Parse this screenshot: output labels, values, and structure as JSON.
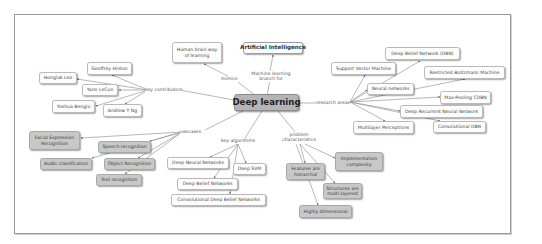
{
  "concept_map": {
    "central": "Deep learning",
    "parent": {
      "label": "Artificial Intelligence",
      "link": "Machine learning branch for"
    },
    "mimics": {
      "label": "Human brain way of learning",
      "link": "mimics"
    },
    "research_areas": {
      "link": "research areas",
      "items": [
        "Support Vector Machine",
        "Deep Belief Network (DBN)",
        "Restricted Boltzmann Machine",
        "Neural networks",
        "Max-Pooling CDBN",
        "Deep Recurrent Neural Network",
        "Convolutional DBN",
        "Multilayer Perceptrons"
      ]
    },
    "key_contributors": {
      "link": "key contributors",
      "items": [
        "Geoffrey Hinton",
        "Honglak Lee",
        "Yann LeCun",
        "Yoshua Bengio",
        "Andrew Y Ng"
      ]
    },
    "usecases": {
      "link": "usecases",
      "items": [
        "Facial Expression Recognition",
        "Speech recognition",
        "Audio classification",
        "Object Recognition",
        "Text recognition"
      ]
    },
    "key_algorithms": {
      "link": "key algorithms",
      "items": [
        "Deep Neural Networks",
        "Deep SVM",
        "Deep Belief Networks",
        "Convolutional Deep Belief Networks"
      ]
    },
    "problem_characteristics": {
      "link": "problem characteristics",
      "items": [
        "Features are hierarchal",
        "Implementation complexity",
        "Structures are multi-layered",
        "Highly dimensional"
      ]
    }
  },
  "colors": {
    "central_fill": "#b5b5b5",
    "gray_node_fill": "#c8c8c8",
    "white_node_fill": "#fdfdfd",
    "edge": "#9a9a9a",
    "frame": "#9a9a9a"
  }
}
